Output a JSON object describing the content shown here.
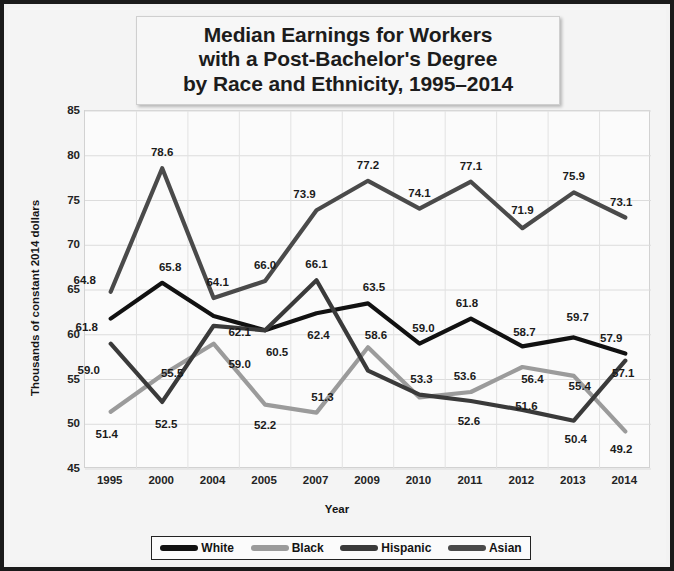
{
  "chart_data": {
    "type": "line",
    "title": "Median Earnings for Workers with a Post-Bachelor's Degree by Race and Ethnicity, 1995–2014",
    "title_lines": [
      "Median Earnings for Workers",
      "with a Post-Bachelor's Degree",
      "by Race and Ethnicity, 1995–2014"
    ],
    "xlabel": "Year",
    "ylabel": "Thousands of constant 2014 dollars",
    "categories": [
      "1995",
      "2000",
      "2004",
      "2005",
      "2007",
      "2009",
      "2010",
      "2011",
      "2012",
      "2013",
      "2014"
    ],
    "ylim": [
      45,
      85
    ],
    "yticks": [
      45,
      50,
      55,
      60,
      65,
      70,
      75,
      80,
      85
    ],
    "grid": true,
    "legend_position": "bottom",
    "series": [
      {
        "name": "White",
        "color": "#111111",
        "values": [
          61.8,
          65.8,
          62.1,
          60.5,
          62.4,
          63.5,
          59.0,
          61.8,
          58.7,
          59.7,
          57.9
        ],
        "labels": [
          "61.8",
          "65.8",
          "62.1",
          "60.5",
          "62.4",
          "63.5",
          "59.0",
          "61.8",
          "58.7",
          "59.7",
          "57.9"
        ]
      },
      {
        "name": "Black",
        "color": "#9b9b9b",
        "values": [
          51.4,
          55.5,
          59.0,
          52.2,
          51.3,
          58.6,
          53.0,
          53.6,
          56.4,
          55.4,
          49.2
        ],
        "labels": [
          "51.4",
          "55.5",
          "59.0",
          "52.2",
          "51.3",
          "58.6",
          "",
          "53.6",
          "56.4",
          "55.4",
          "49.2"
        ]
      },
      {
        "name": "Hispanic",
        "color": "#3a3a3a",
        "values": [
          59.0,
          52.5,
          61.0,
          60.5,
          66.1,
          56.0,
          53.3,
          52.6,
          51.6,
          50.4,
          57.1
        ],
        "labels": [
          "59.0",
          "52.5",
          "",
          "",
          "66.1",
          "",
          "53.3",
          "52.6",
          "51.6",
          "50.4",
          "57.1"
        ]
      },
      {
        "name": "Asian",
        "color": "#4a4a4a",
        "values": [
          64.8,
          78.6,
          64.1,
          66.0,
          73.9,
          77.2,
          74.1,
          77.1,
          71.9,
          75.9,
          73.1
        ],
        "labels": [
          "64.8",
          "78.6",
          "64.1",
          "66.0",
          "73.9",
          "77.2",
          "74.1",
          "77.1",
          "71.9",
          "75.9",
          "73.1"
        ]
      }
    ],
    "annotations": [
      {
        "text": "64.8",
        "x": 0,
        "y": 64.8,
        "dx": -26,
        "dy": -12
      },
      {
        "text": "61.8",
        "x": 0,
        "y": 61.8,
        "dx": -24,
        "dy": 8
      },
      {
        "text": "59.0",
        "x": 0,
        "y": 59.0,
        "dx": -22,
        "dy": 26
      },
      {
        "text": "51.4",
        "x": 0,
        "y": 51.4,
        "dx": -4,
        "dy": 22
      },
      {
        "text": "78.6",
        "x": 1,
        "y": 78.6,
        "dx": 0,
        "dy": -16
      },
      {
        "text": "65.8",
        "x": 1,
        "y": 65.8,
        "dx": 8,
        "dy": -16
      },
      {
        "text": "55.5",
        "x": 1,
        "y": 55.5,
        "dx": 10,
        "dy": -2
      },
      {
        "text": "52.5",
        "x": 1,
        "y": 52.5,
        "dx": 4,
        "dy": 22
      },
      {
        "text": "64.1",
        "x": 2,
        "y": 64.1,
        "dx": 4,
        "dy": -16
      },
      {
        "text": "62.1",
        "x": 2,
        "y": 62.1,
        "dx": 26,
        "dy": 16
      },
      {
        "text": "59.0",
        "x": 2,
        "y": 59.0,
        "dx": 26,
        "dy": 20
      },
      {
        "text": "66.0",
        "x": 3,
        "y": 66.0,
        "dx": 0,
        "dy": -16
      },
      {
        "text": "60.5",
        "x": 3,
        "y": 60.5,
        "dx": 12,
        "dy": 22
      },
      {
        "text": "52.2",
        "x": 3,
        "y": 52.2,
        "dx": 0,
        "dy": 20
      },
      {
        "text": "73.9",
        "x": 4,
        "y": 73.9,
        "dx": -12,
        "dy": -16
      },
      {
        "text": "66.1",
        "x": 4,
        "y": 66.1,
        "dx": 0,
        "dy": -16
      },
      {
        "text": "62.4",
        "x": 4,
        "y": 62.4,
        "dx": 2,
        "dy": 22
      },
      {
        "text": "51.3",
        "x": 4,
        "y": 51.3,
        "dx": 6,
        "dy": -16
      },
      {
        "text": "77.2",
        "x": 5,
        "y": 77.2,
        "dx": 0,
        "dy": -16
      },
      {
        "text": "63.5",
        "x": 5,
        "y": 63.5,
        "dx": 6,
        "dy": -16
      },
      {
        "text": "58.6",
        "x": 5,
        "y": 58.6,
        "dx": 8,
        "dy": -12
      },
      {
        "text": "74.1",
        "x": 6,
        "y": 74.1,
        "dx": 0,
        "dy": -16
      },
      {
        "text": "59.0",
        "x": 6,
        "y": 59.0,
        "dx": 4,
        "dy": -16
      },
      {
        "text": "53.3",
        "x": 6,
        "y": 53.3,
        "dx": 2,
        "dy": -16
      },
      {
        "text": "77.1",
        "x": 7,
        "y": 77.1,
        "dx": 0,
        "dy": -16
      },
      {
        "text": "61.8",
        "x": 7,
        "y": 61.8,
        "dx": -4,
        "dy": -16
      },
      {
        "text": "53.6",
        "x": 7,
        "y": 53.6,
        "dx": -6,
        "dy": -16
      },
      {
        "text": "52.6",
        "x": 7,
        "y": 52.6,
        "dx": -2,
        "dy": 20
      },
      {
        "text": "71.9",
        "x": 8,
        "y": 71.9,
        "dx": 0,
        "dy": -18
      },
      {
        "text": "58.7",
        "x": 8,
        "y": 58.7,
        "dx": 2,
        "dy": -14
      },
      {
        "text": "56.4",
        "x": 8,
        "y": 56.4,
        "dx": 10,
        "dy": 12
      },
      {
        "text": "51.6",
        "x": 8,
        "y": 51.6,
        "dx": 4,
        "dy": -4
      },
      {
        "text": "75.9",
        "x": 9,
        "y": 75.9,
        "dx": 0,
        "dy": -16
      },
      {
        "text": "59.7",
        "x": 9,
        "y": 59.7,
        "dx": 4,
        "dy": -20
      },
      {
        "text": "55.4",
        "x": 9,
        "y": 55.4,
        "dx": 6,
        "dy": 10
      },
      {
        "text": "50.4",
        "x": 9,
        "y": 50.4,
        "dx": 2,
        "dy": 18
      },
      {
        "text": "73.1",
        "x": 10,
        "y": 73.1,
        "dx": -4,
        "dy": -16
      },
      {
        "text": "57.9",
        "x": 10,
        "y": 57.9,
        "dx": -14,
        "dy": -16
      },
      {
        "text": "57.1",
        "x": 10,
        "y": 57.1,
        "dx": -2,
        "dy": 12
      },
      {
        "text": "49.2",
        "x": 10,
        "y": 49.2,
        "dx": -4,
        "dy": 18
      }
    ]
  },
  "legend": {
    "items": [
      {
        "label": "White",
        "color": "#111111"
      },
      {
        "label": "Black",
        "color": "#9b9b9b"
      },
      {
        "label": "Hispanic",
        "color": "#3a3a3a"
      },
      {
        "label": "Asian",
        "color": "#4a4a4a"
      }
    ]
  }
}
